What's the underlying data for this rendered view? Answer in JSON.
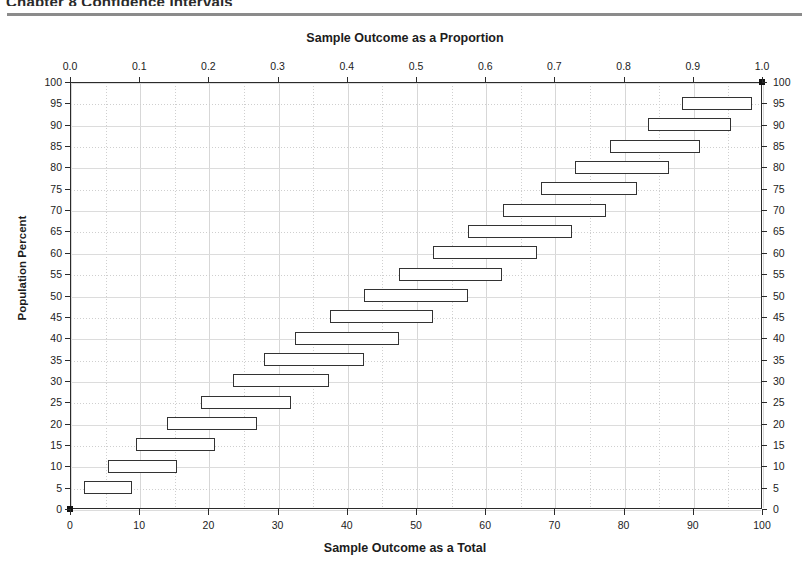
{
  "header": {
    "cut_text": "Chapter 8 Confidence Intervals",
    "rule_color": "#8b8b8b"
  },
  "titles": {
    "top_axis_title": "Sample Outcome as a Proportion",
    "bottom_axis_title": "Sample Outcome as a Total",
    "y_axis_title": "Population Percent"
  },
  "axes": {
    "x_bottom": {
      "label": "Sample Outcome as a Total",
      "min": 0,
      "max": 100,
      "tick_step": 10,
      "minor_step": 5,
      "ticks": [
        0,
        10,
        20,
        30,
        40,
        50,
        60,
        70,
        80,
        90,
        100
      ],
      "tick_labels": [
        "0",
        "10",
        "20",
        "30",
        "40",
        "50",
        "60",
        "70",
        "80",
        "90",
        "100"
      ]
    },
    "x_top": {
      "label": "Sample Outcome as a Proportion",
      "min": 0,
      "max": 1,
      "ticks": [
        0,
        0.1,
        0.2,
        0.3,
        0.4,
        0.5,
        0.6,
        0.7,
        0.8,
        0.9,
        1.0
      ],
      "tick_labels": [
        "0.0",
        "0.1",
        "0.2",
        "0.3",
        "0.4",
        "0.5",
        "0.6",
        "0.7",
        "0.8",
        "0.9",
        "1.0"
      ]
    },
    "y_left": {
      "label": "Population Percent",
      "min": 0,
      "max": 100,
      "tick_step": 5,
      "ticks": [
        0,
        5,
        10,
        15,
        20,
        25,
        30,
        35,
        40,
        45,
        50,
        55,
        60,
        65,
        70,
        75,
        80,
        85,
        90,
        95,
        100
      ],
      "tick_labels": [
        "0",
        "5",
        "10",
        "15",
        "20",
        "25",
        "30",
        "35",
        "40",
        "45",
        "50",
        "55",
        "60",
        "65",
        "70",
        "75",
        "80",
        "85",
        "90",
        "95",
        "100"
      ]
    },
    "y_right": {
      "ticks": [
        0,
        5,
        10,
        15,
        20,
        25,
        30,
        35,
        40,
        45,
        50,
        55,
        60,
        65,
        70,
        75,
        80,
        85,
        90,
        95,
        100
      ],
      "tick_labels": [
        "0",
        "5",
        "10",
        "15",
        "20",
        "25",
        "30",
        "35",
        "40",
        "45",
        "50",
        "55",
        "60",
        "65",
        "70",
        "75",
        "80",
        "85",
        "90",
        "95",
        "100"
      ]
    }
  },
  "style": {
    "frame_color": "#2b2b2b",
    "bar_border_color": "#333333",
    "bar_fill_color": "#ffffff",
    "grid_major_color": "#d7d7d7",
    "grid_minor_color": "#cfcfcf",
    "text_color": "#1c1c1c"
  },
  "chart_data": {
    "type": "bar",
    "title": "Sample Outcome as a Proportion",
    "subtitle": "Sample Outcome as a Total",
    "xlabel": "Sample Outcome as a Total",
    "ylabel": "Population Percent",
    "xlim": [
      0,
      100
    ],
    "ylim": [
      0,
      100
    ],
    "grid": true,
    "legend": "none",
    "orientation": "horizontal",
    "categories": [
      0,
      5,
      10,
      15,
      20,
      25,
      30,
      35,
      40,
      45,
      50,
      55,
      60,
      65,
      70,
      75,
      80,
      85,
      90,
      95,
      100
    ],
    "series": [
      {
        "name": "Interval low",
        "values": [
          0.0,
          2.0,
          5.5,
          9.5,
          14.0,
          19.0,
          23.5,
          28.0,
          32.5,
          37.5,
          42.5,
          47.5,
          52.5,
          57.5,
          62.5,
          68.0,
          73.0,
          78.0,
          83.5,
          88.5,
          100.0
        ]
      },
      {
        "name": "Interval high",
        "values": [
          0.0,
          9.0,
          14.5,
          19.5,
          25.0,
          30.0,
          35.0,
          40.0,
          45.0,
          50.0,
          57.5,
          62.5,
          67.5,
          72.5,
          77.5,
          82.0,
          86.5,
          91.0,
          95.5,
          98.5,
          100.0
        ]
      }
    ],
    "bars": [
      {
        "population_percent": 100,
        "low": 100.0,
        "high": 100.0,
        "is_point": true
      },
      {
        "population_percent": 95,
        "low": 88.5,
        "high": 98.5,
        "is_point": false
      },
      {
        "population_percent": 90,
        "low": 83.5,
        "high": 95.5,
        "is_point": false
      },
      {
        "population_percent": 85,
        "low": 78.0,
        "high": 91.0,
        "is_point": false
      },
      {
        "population_percent": 80,
        "low": 73.0,
        "high": 86.5,
        "is_point": false
      },
      {
        "population_percent": 75,
        "low": 68.0,
        "high": 82.0,
        "is_point": false
      },
      {
        "population_percent": 70,
        "low": 62.5,
        "high": 77.5,
        "is_point": false
      },
      {
        "population_percent": 65,
        "low": 57.5,
        "high": 72.5,
        "is_point": false
      },
      {
        "population_percent": 60,
        "low": 52.5,
        "high": 67.5,
        "is_point": false
      },
      {
        "population_percent": 55,
        "low": 47.5,
        "high": 62.5,
        "is_point": false
      },
      {
        "population_percent": 50,
        "low": 42.5,
        "high": 57.5,
        "is_point": false
      },
      {
        "population_percent": 45,
        "low": 37.5,
        "high": 52.5,
        "is_point": false
      },
      {
        "population_percent": 40,
        "low": 32.5,
        "high": 47.5,
        "is_point": false
      },
      {
        "population_percent": 35,
        "low": 28.0,
        "high": 42.5,
        "is_point": false
      },
      {
        "population_percent": 30,
        "low": 23.5,
        "high": 37.5,
        "is_point": false
      },
      {
        "population_percent": 25,
        "low": 19.0,
        "high": 32.0,
        "is_point": false
      },
      {
        "population_percent": 20,
        "low": 14.0,
        "high": 27.0,
        "is_point": false
      },
      {
        "population_percent": 15,
        "low": 9.5,
        "high": 21.0,
        "is_point": false
      },
      {
        "population_percent": 10,
        "low": 5.5,
        "high": 15.5,
        "is_point": false
      },
      {
        "population_percent": 5,
        "low": 2.0,
        "high": 9.0,
        "is_point": false
      },
      {
        "population_percent": 0,
        "low": 0.0,
        "high": 0.0,
        "is_point": true
      }
    ]
  }
}
